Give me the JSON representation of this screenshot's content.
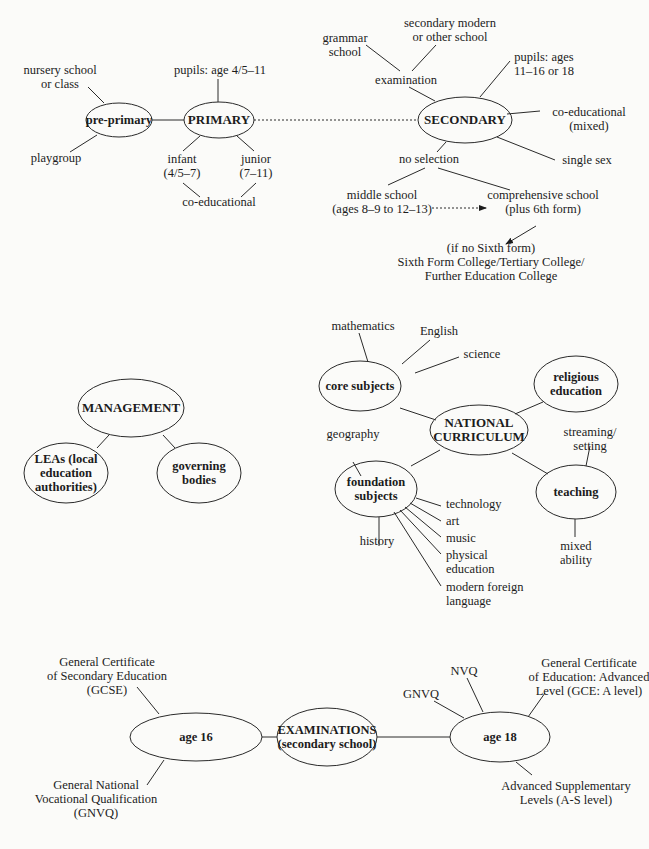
{
  "school_types": {
    "nodes": {
      "pre_primary": "pre-primary",
      "primary": "PRIMARY",
      "secondary": "SECONDARY"
    },
    "labels": {
      "nursery": [
        "nursery school",
        "or class"
      ],
      "playgroup": "playgroup",
      "primary_ages": "pupils: age 4/5–11",
      "infant": [
        "infant",
        "(4/5–7)"
      ],
      "junior": [
        "junior",
        "(7–11)"
      ],
      "co_educational_primary": "co-educational",
      "grammar": [
        "grammar",
        "school"
      ],
      "secondary_modern": [
        "secondary modern",
        "or other school"
      ],
      "examination": "examination",
      "secondary_ages": [
        "pupils: ages",
        "11–16 or 18"
      ],
      "co_educational_secondary": [
        "co-educational",
        "(mixed)"
      ],
      "single_sex": "single sex",
      "no_selection": "no selection",
      "middle_school": [
        "middle school",
        "(ages 8–9 to 12–13)"
      ],
      "comprehensive": [
        "comprehensive school",
        "(plus 6th form)"
      ],
      "sixth_form": [
        "(if no Sixth form)",
        "Sixth Form College/Tertiary College/",
        "Further Education College"
      ]
    }
  },
  "management": {
    "nodes": {
      "management": "MANAGEMENT",
      "leas": [
        "LEAs (local",
        "education",
        "authorities)"
      ],
      "governing": [
        "governing",
        "bodies"
      ]
    }
  },
  "curriculum": {
    "nodes": {
      "national": [
        "NATIONAL",
        "CURRICULUM"
      ],
      "core": "core subjects",
      "religious": [
        "religious",
        "education"
      ],
      "foundation": [
        "foundation",
        "subjects"
      ],
      "teaching": "teaching"
    },
    "labels": {
      "mathematics": "mathematics",
      "english": "English",
      "science": "science",
      "geography": "geography",
      "history": "history",
      "technology": "technology",
      "art": "art",
      "music": "music",
      "physical_education": [
        "physical",
        "education"
      ],
      "modern_foreign_language": [
        "modern foreign",
        "language"
      ],
      "streaming": [
        "streaming/",
        "setting"
      ],
      "mixed_ability": [
        "mixed",
        "ability"
      ]
    }
  },
  "examinations": {
    "nodes": {
      "exams": [
        "EXAMINATIONS",
        "(secondary school)"
      ],
      "age16": "age 16",
      "age18": "age 18"
    },
    "labels": {
      "gcse": [
        "General Certificate",
        "of Secondary Education",
        "(GCSE)"
      ],
      "gnvq16": [
        "General National",
        "Vocational Qualification",
        "(GNVQ)"
      ],
      "gnvq18": "GNVQ",
      "nvq": "NVQ",
      "gce_a": [
        "General Certificate",
        "of Education: Advanced",
        "Level (GCE: A level)"
      ],
      "as_level": [
        "Advanced Supplementary",
        "Levels (A-S level)"
      ]
    }
  }
}
